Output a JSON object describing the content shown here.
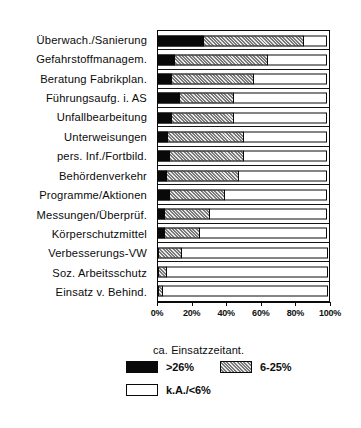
{
  "chart_data": {
    "type": "bar",
    "orientation": "horizontal",
    "stacked": true,
    "title": "",
    "xlabel": "",
    "ylabel": "",
    "xlim": [
      0,
      100
    ],
    "grid": false,
    "legend_position": "bottom",
    "legend_title": "ca. Einsatzzeitant.",
    "xticks": [
      "0%",
      "20%",
      "40%",
      "60%",
      "80%",
      "100%"
    ],
    "xtick_values": [
      0,
      20,
      40,
      60,
      80,
      100
    ],
    "categories": [
      "Überwach./Sanierung",
      "Gefahrstoffmanagem.",
      "Beratung Fabrikplan.",
      "Führungsaufg. i. AS",
      "Unfallbearbeitung",
      "Unterweisungen",
      "pers. Inf./Fortbild.",
      "Behördenverkehr",
      "Programme/Aktionen",
      "Messungen/Überprüf.",
      "Körperschutzmittel",
      "Verbesserungs-VW",
      "Soz. Arbeitsschutz",
      "Einsatz v. Behind."
    ],
    "series": [
      {
        "name": ">26%",
        "key": "high",
        "color": "#090909",
        "pattern": "solid",
        "values": [
          27,
          10,
          8,
          13,
          8,
          6,
          7,
          5,
          7,
          4,
          4,
          0,
          0,
          0
        ]
      },
      {
        "name": "6-25%",
        "key": "mid",
        "color": "#a8a8a8",
        "pattern": "hatched",
        "values": [
          59,
          55,
          49,
          32,
          37,
          45,
          44,
          43,
          33,
          27,
          21,
          14,
          5,
          3
        ]
      },
      {
        "name": "k.A./<6%",
        "key": "low",
        "color": "#ffffff",
        "pattern": "empty",
        "values": [
          14,
          35,
          43,
          55,
          55,
          49,
          49,
          52,
          60,
          69,
          75,
          86,
          95,
          97
        ]
      }
    ]
  },
  "legend": {
    "title": "ca. Einsatzzeitant.",
    "items": [
      {
        "label": ">26%",
        "swatch": "high"
      },
      {
        "label": "6-25%",
        "swatch": "mid"
      },
      {
        "label": "k.A./<6%",
        "swatch": "low"
      }
    ]
  }
}
